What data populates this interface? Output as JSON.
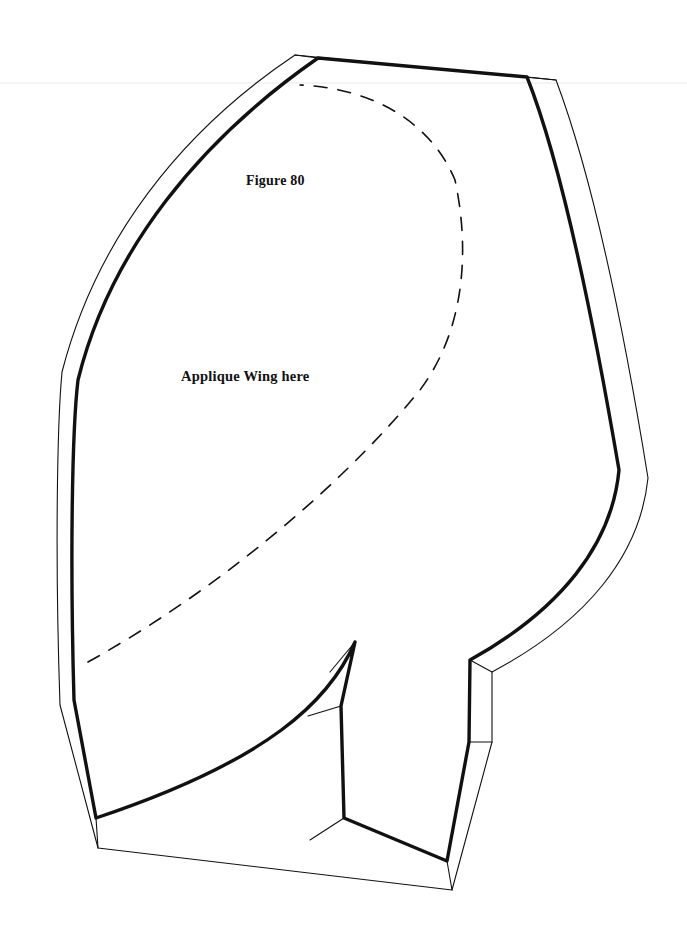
{
  "document": {
    "type": "sewing-pattern-template",
    "background_color": "#ffffff",
    "ink_color": "#111111",
    "width": 687,
    "height": 941
  },
  "labels": {
    "figure": "Figure 80",
    "applique": "Applique Wing here"
  },
  "lines": {
    "cut_line_name": "thick-inner-sewing-line",
    "seam_line_name": "thin-outer-cutting-line",
    "guide_line_name": "dashed-applique-placement-line",
    "thick_width": "3.4",
    "thin_width": "1.1",
    "dash_width": "1.6",
    "dash_pattern": "13 11"
  },
  "geometry": {
    "thick_outline": "M 318 58 L 527 77 C 560 160 590 300 619 470 C 612 545 560 610 470 660 L 469 742 L 447 861 L 344 818 L 341 706 L 355 642 C 330 700 270 760 96 818 L 74 700 C 70 560 72 430 78 380 C 110 250 200 140 318 58 Z",
    "thin_outline": "M 295 55 L 556 80 C 588 165 620 305 648 478 C 640 556 586 622 492 672 L 492 742 L 452 890 L 98 848 L 60 705 C 55 560 57 425 62 372 C 96 240 180 132 295 55 Z",
    "inner_connectors": [
      "M 470 660 L 492 672",
      "M 469 742 L 492 742",
      "M 447 861 L 452 890",
      "M 344 818 L 310 840",
      "M 341 706 L 308 716",
      "M 355 642 L 330 672",
      "M 96 818 L 98 848",
      "M 527 77 L 556 80",
      "M 318 58 L 295 55"
    ],
    "dashed_guide": "M 88 662 C 200 600 330 500 420 390 C 465 330 470 250 455 180 C 430 120 370 88 300 85"
  },
  "artifacts": {
    "scan_line_y": 83,
    "scan_line_color": "#f0f0f0"
  }
}
